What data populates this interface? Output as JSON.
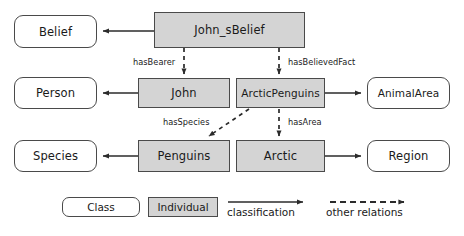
{
  "diagram": {
    "colors": {
      "individual_fill": "#d4d4d4",
      "class_fill": "#ffffff",
      "stroke": "#4a4a4a",
      "arrow": "#2b2b2b",
      "text": "#1a1a1a",
      "background": "#ffffff"
    },
    "nodes": [
      {
        "id": "belief",
        "label": "Belief",
        "kind": "class",
        "x": 14,
        "y": 15,
        "w": 83,
        "h": 33
      },
      {
        "id": "john_sbelief",
        "label": "John_sBelief",
        "kind": "individual",
        "x": 154,
        "y": 12,
        "w": 151,
        "h": 36
      },
      {
        "id": "person",
        "label": "Person",
        "kind": "class",
        "x": 14,
        "y": 77,
        "w": 83,
        "h": 32
      },
      {
        "id": "john",
        "label": "John",
        "kind": "individual",
        "x": 138,
        "y": 78,
        "w": 92,
        "h": 30
      },
      {
        "id": "arcticpenguins",
        "label": "ArcticPenguins",
        "kind": "individual",
        "x": 236,
        "y": 78,
        "w": 89,
        "h": 30
      },
      {
        "id": "animalarea",
        "label": "AnimalArea",
        "kind": "class",
        "x": 367,
        "y": 77,
        "w": 83,
        "h": 32
      },
      {
        "id": "species",
        "label": "Species",
        "kind": "class",
        "x": 14,
        "y": 140,
        "w": 83,
        "h": 32
      },
      {
        "id": "penguins",
        "label": "Penguins",
        "kind": "individual",
        "x": 138,
        "y": 140,
        "w": 92,
        "h": 32
      },
      {
        "id": "arctic",
        "label": "Arctic",
        "kind": "individual",
        "x": 236,
        "y": 140,
        "w": 89,
        "h": 32
      },
      {
        "id": "region",
        "label": "Region",
        "kind": "class",
        "x": 367,
        "y": 140,
        "w": 83,
        "h": 32
      }
    ],
    "edges": [
      {
        "id": "john_sbelief-to-belief",
        "from": "john_sbelief",
        "to": "belief",
        "style": "classification",
        "label": ""
      },
      {
        "id": "john-to-person",
        "from": "john",
        "to": "person",
        "style": "classification",
        "label": ""
      },
      {
        "id": "arcticpenguins-to-animalarea",
        "from": "arcticpenguins",
        "to": "animalarea",
        "style": "classification",
        "label": ""
      },
      {
        "id": "penguins-to-species",
        "from": "penguins",
        "to": "species",
        "style": "classification",
        "label": ""
      },
      {
        "id": "arctic-to-region",
        "from": "arctic",
        "to": "region",
        "style": "classification",
        "label": ""
      },
      {
        "id": "john_sbelief-to-john",
        "from": "john_sbelief",
        "to": "john",
        "style": "other",
        "label": "hasBearer"
      },
      {
        "id": "john_sbelief-to-arcticpenguins",
        "from": "john_sbelief",
        "to": "arcticpenguins",
        "style": "other",
        "label": "hasBelievedFact"
      },
      {
        "id": "arcticpenguins-to-penguins",
        "from": "arcticpenguins",
        "to": "penguins",
        "style": "other",
        "label": "hasSpecies"
      },
      {
        "id": "arcticpenguins-to-arctic",
        "from": "arcticpenguins",
        "to": "arctic",
        "style": "other",
        "label": "hasArea"
      }
    ],
    "edge_labels": {
      "hasBearer": "hasBearer",
      "hasBelievedFact": "hasBelievedFact",
      "hasSpecies": "hasSpecies",
      "hasArea": "hasArea"
    },
    "legend": {
      "class_label": "Class",
      "individual_label": "Individual",
      "classification_label": "classification",
      "other_relations_label": "other relations"
    }
  }
}
